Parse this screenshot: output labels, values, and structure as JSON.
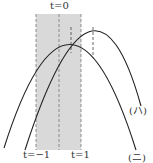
{
  "labels": {
    "t0": "t=0",
    "tm1": "t=−1",
    "t1": "t=1",
    "curve_ha": "(ハ)",
    "curve_ni": "(ニ)"
  },
  "colors": {
    "shade": "#d9d9d9",
    "line": "#222222",
    "dash": "#666666"
  }
}
